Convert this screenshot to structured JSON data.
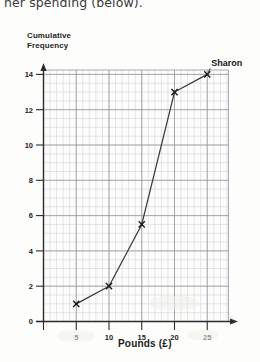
{
  "question": {
    "text": "her spending (below)."
  },
  "chart_data": {
    "type": "line",
    "title": "",
    "ylabel_line1": "Cumulative",
    "ylabel_line2": "Frequency",
    "ylabel": "Cumulative Frequency",
    "xlabel": "Pounds (£)",
    "x": [
      5,
      10,
      15,
      20,
      25
    ],
    "values": [
      1,
      2,
      5.5,
      13,
      14
    ],
    "series": [
      {
        "name": "Sharon",
        "x": [
          5,
          10,
          15,
          20,
          25
        ],
        "values": [
          1,
          2,
          5.5,
          13,
          14
        ]
      }
    ],
    "xticks": [
      0,
      5,
      10,
      15,
      20,
      25
    ],
    "xtick_labels": [
      "",
      "5",
      "10",
      "15",
      "20",
      "25"
    ],
    "yticks": [
      0,
      2,
      4,
      6,
      8,
      10,
      12,
      14
    ],
    "ytick_labels": [
      "0",
      "2",
      "4",
      "6",
      "8",
      "10",
      "12",
      "14"
    ],
    "xlim": [
      0,
      27.5
    ],
    "ylim": [
      0,
      14.9
    ],
    "grid": true,
    "grid_minor": true,
    "marker": "x",
    "legend_position": "none",
    "annotations": [
      {
        "text": "Sharon",
        "x": 25,
        "y": 14
      }
    ],
    "colors": {
      "line": "#3a3a3a",
      "grid_major": "#9a9aa6",
      "grid_minor": "#c9c9d2",
      "axis": "#2b2b2b",
      "text": "#1d1d1d",
      "background": "#fdfdfc"
    }
  }
}
